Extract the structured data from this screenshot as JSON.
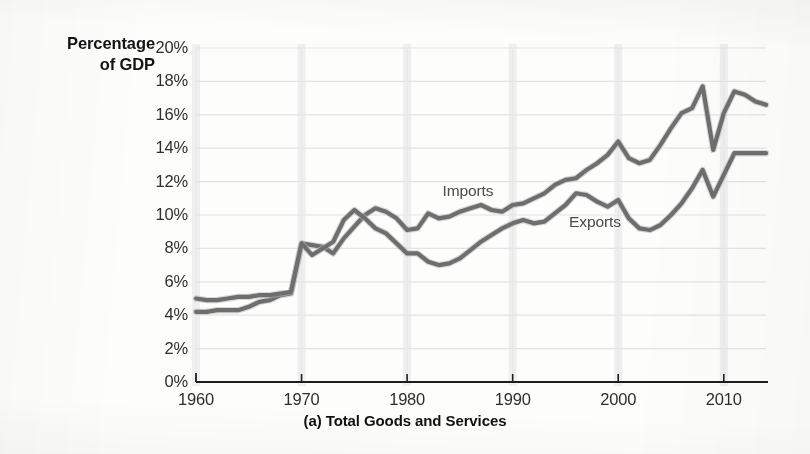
{
  "figure": {
    "caption": "(a) Total Goods and Services",
    "y_axis_title_line1": "Percentage",
    "y_axis_title_line2": "of GDP"
  },
  "series_labels": {
    "imports": "Imports",
    "exports": "Exports"
  },
  "chart_data": {
    "type": "line",
    "title": "(a) Total Goods and Services",
    "xlabel": "",
    "ylabel": "Percentage of GDP",
    "xlim": [
      1960,
      2014
    ],
    "ylim": [
      0,
      20
    ],
    "grid": true,
    "legend": "inline-annotations",
    "ytick_labels": [
      "0%",
      "2%",
      "4%",
      "6%",
      "8%",
      "10%",
      "12%",
      "14%",
      "16%",
      "18%",
      "20%"
    ],
    "ytick_values": [
      0,
      2,
      4,
      6,
      8,
      10,
      12,
      14,
      16,
      18,
      20
    ],
    "xtick_labels": [
      "1960",
      "1970",
      "1980",
      "1990",
      "2000",
      "2010"
    ],
    "xtick_values": [
      1960,
      1970,
      1980,
      1990,
      2000,
      2010
    ],
    "x": [
      1960,
      1961,
      1962,
      1963,
      1964,
      1965,
      1966,
      1967,
      1968,
      1969,
      1970,
      1971,
      1972,
      1973,
      1974,
      1975,
      1976,
      1977,
      1978,
      1979,
      1980,
      1981,
      1982,
      1983,
      1984,
      1985,
      1986,
      1987,
      1988,
      1989,
      1990,
      1991,
      1992,
      1993,
      1994,
      1995,
      1996,
      1997,
      1998,
      1999,
      2000,
      2001,
      2002,
      2003,
      2004,
      2005,
      2006,
      2007,
      2008,
      2009,
      2010,
      2011,
      2012,
      2013,
      2014
    ],
    "series": [
      {
        "name": "Imports",
        "color": "#6e6e6e",
        "values": [
          4.2,
          4.2,
          4.3,
          4.3,
          4.3,
          4.5,
          4.8,
          4.9,
          5.2,
          5.3,
          8.3,
          8.2,
          8.1,
          7.7,
          8.6,
          9.3,
          10.0,
          10.4,
          10.2,
          9.8,
          9.1,
          9.2,
          10.1,
          9.8,
          9.9,
          10.2,
          10.4,
          10.6,
          10.3,
          10.2,
          10.6,
          10.7,
          11.0,
          11.3,
          11.8,
          12.1,
          12.2,
          12.7,
          13.1,
          13.6,
          14.4,
          13.4,
          13.1,
          13.3,
          14.2,
          15.2,
          16.1,
          16.4,
          17.7,
          13.9,
          16.1,
          17.4,
          17.2,
          16.8,
          16.6
        ]
      },
      {
        "name": "Exports",
        "color": "#6e6e6e",
        "values": [
          5.0,
          4.9,
          4.9,
          5.0,
          5.1,
          5.1,
          5.2,
          5.2,
          5.3,
          5.4,
          8.3,
          7.6,
          8.0,
          8.4,
          9.7,
          10.3,
          9.8,
          9.2,
          8.9,
          8.3,
          7.7,
          7.7,
          7.2,
          7.0,
          7.1,
          7.4,
          7.9,
          8.4,
          8.8,
          9.2,
          9.5,
          9.7,
          9.5,
          9.6,
          10.1,
          10.6,
          11.3,
          11.2,
          10.8,
          10.5,
          10.9,
          9.8,
          9.2,
          9.1,
          9.4,
          10.0,
          10.7,
          11.6,
          12.7,
          11.1,
          12.4,
          13.7,
          13.7,
          13.7,
          13.7
        ]
      }
    ],
    "annotations": [
      {
        "text": "Imports",
        "x": 1986,
        "y": 11.4
      },
      {
        "text": "Exports",
        "x": 1998,
        "y": 9.5
      }
    ]
  }
}
